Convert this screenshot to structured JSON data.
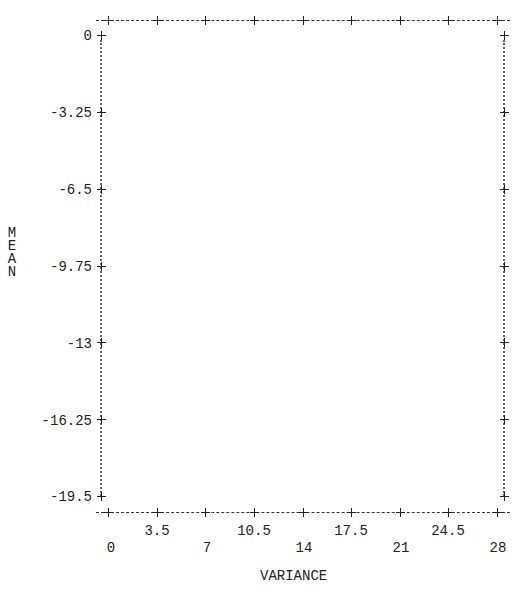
{
  "chart_data": {
    "type": "scatter",
    "title": "",
    "xlabel": "VARIANCE",
    "ylabel": "MEAN",
    "xlim": [
      0,
      28
    ],
    "ylim": [
      -19.5,
      0
    ],
    "x_ticks": [
      0,
      3.5,
      7,
      10.5,
      14,
      17.5,
      21,
      24.5,
      28
    ],
    "x_tick_labels": [
      "0",
      "3.5",
      "7",
      "10.5",
      "14",
      "17.5",
      "21",
      "24.5",
      "28"
    ],
    "y_ticks": [
      0,
      -3.25,
      -6.5,
      -9.75,
      -13,
      -16.25,
      -19.5
    ],
    "y_tick_labels": [
      "0",
      "-3.25",
      "-6.5",
      "-9.75",
      "-13",
      "-16.25",
      "-19.5"
    ],
    "series": [],
    "grid": false,
    "legend": null,
    "style": "ascii line-printer plot frame (no data points plotted)"
  },
  "axes": {
    "xlabel": "VARIANCE",
    "ylabel_letters": [
      "M",
      "E",
      "A",
      "N"
    ],
    "y_ticks": [
      "0",
      "-3.25",
      "-6.5",
      "-9.75",
      "-13",
      "-16.25",
      "-19.5"
    ],
    "x_ticks_upper": [
      "3.5",
      "10.5",
      "17.5",
      "24.5"
    ],
    "x_ticks_lower": [
      "0",
      "7",
      "14",
      "21",
      "28"
    ]
  }
}
